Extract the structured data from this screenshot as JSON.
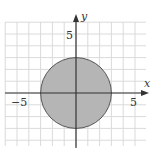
{
  "chart_data": {
    "type": "area",
    "title": "",
    "xlabel": "x",
    "ylabel": "y",
    "xlim": [
      -6,
      6
    ],
    "ylim": [
      -4.5,
      6
    ],
    "grid": true,
    "x_ticks_labeled": [
      -5,
      5
    ],
    "y_ticks_labeled": [
      5
    ],
    "shapes": [
      {
        "kind": "circle",
        "center": [
          0,
          0
        ],
        "radius": 3,
        "filled": true,
        "fill": "#b5b5b5",
        "stroke": "#555555"
      }
    ]
  },
  "labels": {
    "x_axis": "x",
    "y_axis": "y",
    "x_neg": "−5",
    "x_pos": "5",
    "y_pos": "5"
  },
  "colors": {
    "grid": "#d9d9d9",
    "axis": "#333333",
    "fill": "#b5b5b5",
    "stroke": "#555555"
  }
}
